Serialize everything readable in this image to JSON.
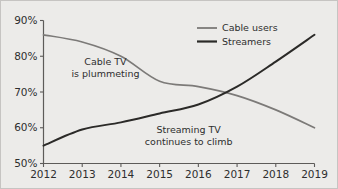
{
  "chart_data": {
    "type": "line",
    "title": "",
    "xlabel": "",
    "ylabel": "",
    "x": [
      2012,
      2013,
      2014,
      2015,
      2016,
      2017,
      2018,
      2019
    ],
    "categories": [
      "2012",
      "2013",
      "2014",
      "2015",
      "2016",
      "2017",
      "2018",
      "2019"
    ],
    "xlim": [
      2012,
      2019
    ],
    "ylim": [
      50,
      90
    ],
    "y_tick_labels": [
      "50%",
      "60%",
      "70%",
      "80%",
      "90%"
    ],
    "y_ticks": [
      50,
      60,
      70,
      80,
      90
    ],
    "grid": false,
    "legend_position": "top-right",
    "series": [
      {
        "name": "Cable users",
        "color": "#7c7a78",
        "values": [
          86,
          84,
          80,
          73,
          71.5,
          69,
          65,
          60
        ]
      },
      {
        "name": "Streamers",
        "color": "#2b2a28",
        "values": [
          55,
          59.5,
          61.5,
          64,
          66.5,
          71.5,
          78.5,
          86
        ]
      }
    ],
    "annotations": [
      {
        "id": "cable-annotation",
        "line1": "Cable TV",
        "line2": "is plummeting",
        "x": 2013.6,
        "y": 77.5
      },
      {
        "id": "streaming-annotation",
        "line1": "Streaming TV",
        "line2": "continues to climb",
        "x": 2015.75,
        "y": 58.5
      }
    ]
  },
  "colors": {
    "background": "#ecebe9",
    "border": "#c6c4c2",
    "axis": "#5d5b59",
    "text": "#2e2e2e",
    "cable": "#7c7a78",
    "streamers": "#2b2a28"
  },
  "legend": {
    "items": [
      {
        "label": "Cable users",
        "color": "#7c7a78"
      },
      {
        "label": "Streamers",
        "color": "#2b2a28"
      }
    ]
  }
}
